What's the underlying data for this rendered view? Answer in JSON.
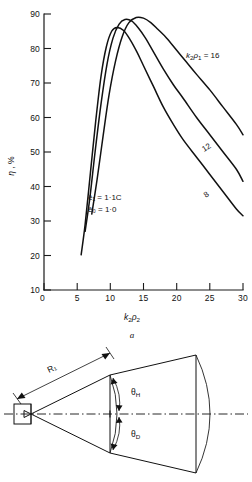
{
  "figure": {
    "panel_a_caption": "a",
    "chart_data": {
      "type": "line",
      "title": "",
      "xlabel": "k2ρ2",
      "ylabel": "η , %",
      "xlim": [
        0,
        30
      ],
      "ylim": [
        10,
        90
      ],
      "grid": false,
      "legend_position": "inline-curve-labels",
      "xticks": [
        0,
        5,
        10,
        15,
        20,
        25,
        30
      ],
      "xticklabels": [
        "0",
        "5",
        "10",
        "15",
        "20",
        "25",
        "30"
      ],
      "yticks": [
        10,
        20,
        30,
        40,
        50,
        60,
        70,
        80,
        90
      ],
      "yticklabels": [
        "10",
        "20",
        "30",
        "40",
        "50",
        "60",
        "70",
        "80",
        "90"
      ],
      "annotations": [
        {
          "text": "ē₁ = 1·1C",
          "x": 13.5,
          "y": 44
        },
        {
          "text": "ē₀ = 1·0",
          "x": 13.5,
          "y": 40
        }
      ],
      "series": [
        {
          "name": "k2ρ1 = 8",
          "label": "8",
          "label_x": 26.0,
          "label_y": 40.5,
          "x": [
            5.6,
            6.2,
            7.0,
            7.8,
            8.6,
            9.4,
            10.2,
            11.0,
            12.0,
            13.0,
            14.0,
            15.0,
            16.5,
            18.0,
            19.5,
            21.0,
            23.0,
            25.0,
            27.0,
            29.0,
            30.0
          ],
          "y": [
            20.2,
            29.0,
            44.0,
            59.0,
            72.0,
            80.5,
            85.0,
            86.1,
            85.2,
            82.5,
            79.0,
            75.0,
            69.0,
            63.0,
            58.0,
            53.5,
            48.5,
            43.5,
            38.5,
            33.5,
            31.5
          ]
        },
        {
          "name": "k2ρ1 = 12",
          "label": "12",
          "label_x": 26.3,
          "label_y": 52.0,
          "x": [
            6.2,
            6.9,
            7.7,
            8.6,
            9.5,
            10.4,
            11.3,
            12.2,
            13.2,
            14.2,
            15.3,
            16.5,
            18.0,
            19.5,
            21.0,
            23.0,
            25.0,
            27.0,
            29.0,
            30.0
          ],
          "y": [
            27.0,
            36.5,
            50.0,
            64.0,
            75.5,
            83.0,
            87.0,
            88.4,
            88.0,
            86.0,
            83.0,
            79.0,
            74.0,
            69.5,
            65.5,
            60.0,
            55.0,
            50.0,
            45.0,
            41.5
          ]
        },
        {
          "name": "k2ρ1 = 16",
          "label": "k2ρ1 = 16",
          "label_x": 24.2,
          "label_y": 76.5,
          "x": [
            7.2,
            8.0,
            8.9,
            9.8,
            10.8,
            11.8,
            12.8,
            13.9,
            15.0,
            16.1,
            17.2,
            18.5,
            20.0,
            21.5,
            23.0,
            25.0,
            27.0,
            29.0,
            30.0
          ],
          "y": [
            32.0,
            42.0,
            54.5,
            66.5,
            76.5,
            83.5,
            87.5,
            89.0,
            88.8,
            87.5,
            85.5,
            83.0,
            79.5,
            76.0,
            72.5,
            68.0,
            63.0,
            58.0,
            55.0
          ]
        }
      ]
    },
    "diagram": {
      "name": "conical-horn-antenna-geometry",
      "labels": [
        {
          "id": "radius",
          "text": "R₁"
        },
        {
          "id": "theta-h",
          "text": "θH"
        },
        {
          "id": "theta-d",
          "text": "θD"
        }
      ]
    }
  }
}
